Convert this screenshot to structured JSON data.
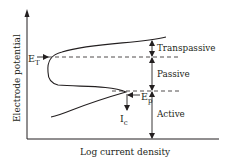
{
  "diagram": {
    "y_axis_label": "Electrode potential",
    "x_axis_label": "Log current density",
    "markers": {
      "e_t": {
        "main": "E",
        "sub": "T"
      },
      "e_p": {
        "main": "E",
        "sub": "p"
      },
      "i_c": {
        "main": "I",
        "sub": "c"
      }
    },
    "regions": {
      "transpassive": "Transpassive",
      "passive": "Passive",
      "active": "Active"
    },
    "colors": {
      "line": "#231f20",
      "background": "#ffffff"
    }
  }
}
